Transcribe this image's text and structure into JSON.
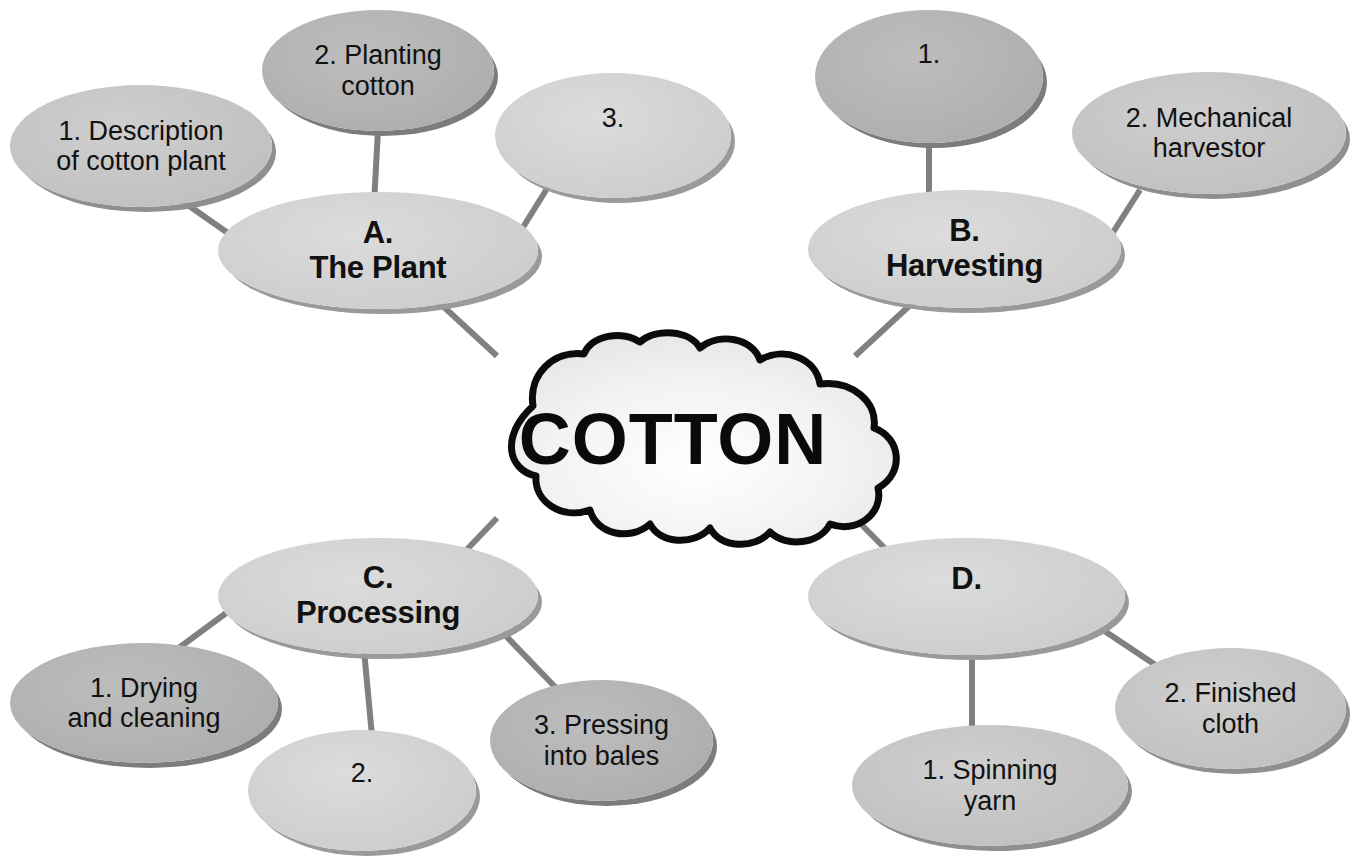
{
  "diagram": {
    "type": "mind-map",
    "center": {
      "id": "center",
      "label": "COTTON",
      "shape": "cloud"
    },
    "branches": [
      {
        "id": "a",
        "label": "A.\nThe Plant",
        "shade": "light",
        "children": [
          {
            "id": "a1",
            "label": "1. Description\nof cotton plant",
            "shade": "mid"
          },
          {
            "id": "a2",
            "label": "2. Planting\ncotton",
            "shade": "dark"
          },
          {
            "id": "a3",
            "label": "3.",
            "shade": "light"
          }
        ]
      },
      {
        "id": "b",
        "label": "B.\nHarvesting",
        "shade": "light",
        "children": [
          {
            "id": "b1",
            "label": "1.",
            "shade": "dark"
          },
          {
            "id": "b2",
            "label": "2. Mechanical\nharvestor",
            "shade": "mid"
          }
        ]
      },
      {
        "id": "c",
        "label": "C.\nProcessing",
        "shade": "light",
        "children": [
          {
            "id": "c1",
            "label": "1. Drying\nand cleaning",
            "shade": "dark"
          },
          {
            "id": "c2",
            "label": "2.",
            "shade": "light"
          },
          {
            "id": "c3",
            "label": "3. Pressing\ninto bales",
            "shade": "dark"
          }
        ]
      },
      {
        "id": "d",
        "label": "D.",
        "shade": "light",
        "children": [
          {
            "id": "d1",
            "label": "1. Spinning\nyarn",
            "shade": "mid"
          },
          {
            "id": "d2",
            "label": "2. Finished\ncloth",
            "shade": "mid"
          }
        ]
      }
    ],
    "colors": {
      "background": "#ffffff",
      "connector": "#808080",
      "text": "#111111",
      "cloud_outline": "#000000",
      "cloud_fill": "#eeeeee",
      "ellipse_light": "#d3d3d3",
      "ellipse_mid": "#c6c6c6",
      "ellipse_dark": "#b4b4b4",
      "ellipse_shadow": "#8f8f8f"
    }
  }
}
